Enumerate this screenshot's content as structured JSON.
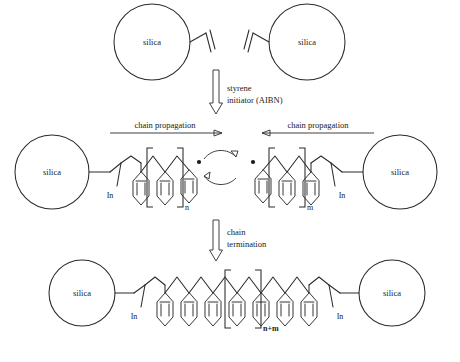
{
  "figure": {
    "type": "reaction-scheme",
    "background": "#ffffff",
    "line_color": "#2b2b2b"
  },
  "labels": {
    "silica": "silica",
    "initiator_fragment": "In",
    "subscript_n": "n",
    "subscript_m": "m",
    "subscript_nm": "n+m"
  },
  "stages": [
    {
      "id": "stage-1",
      "name": "vinyl-functionalized-silica",
      "particles": [
        {
          "label": "silica",
          "side": "left"
        },
        {
          "label": "silica",
          "side": "right"
        }
      ]
    },
    {
      "id": "stage-2",
      "name": "propagating-macroradicals",
      "particles": [
        {
          "label": "silica",
          "side": "left",
          "subscript": "n"
        },
        {
          "label": "silica",
          "side": "right",
          "subscript": "m"
        }
      ],
      "radicals": 2
    },
    {
      "id": "stage-3",
      "name": "terminated-bridged-polymer",
      "particles": [
        {
          "label": "silica",
          "side": "left"
        },
        {
          "label": "silica",
          "side": "right"
        }
      ],
      "subscript": "n+m"
    }
  ],
  "reaction_arrows": [
    {
      "id": "arrow-initiation",
      "direction": "down",
      "style": "hollow",
      "lines": [
        "styrene",
        "initiator (AIBN)"
      ]
    },
    {
      "id": "arrow-termination",
      "direction": "down",
      "style": "hollow",
      "lines": [
        "chain",
        "termination"
      ]
    }
  ],
  "propagation_arrows": [
    {
      "id": "propagation-left",
      "label": "chain propagation",
      "direction": "right"
    },
    {
      "id": "propagation-right",
      "label": "chain propagation",
      "direction": "left"
    }
  ]
}
